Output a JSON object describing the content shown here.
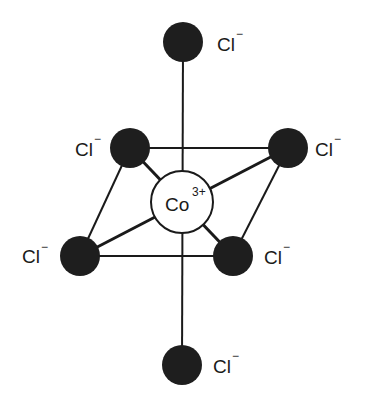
{
  "diagram": {
    "title": "",
    "type": "octahedral complex",
    "central_atom": {
      "symbol": "Co",
      "charge": "3+",
      "x": 182,
      "y": 202,
      "r": 31
    },
    "ligands": [
      {
        "id": "top",
        "symbol": "Cl",
        "charge": "−",
        "x": 183,
        "y": 42,
        "lx": 217,
        "ly": 51
      },
      {
        "id": "upper-left",
        "symbol": "Cl",
        "charge": "−",
        "x": 130,
        "y": 148,
        "lx": 75,
        "ly": 156
      },
      {
        "id": "upper-right",
        "symbol": "Cl",
        "charge": "−",
        "x": 288,
        "y": 148,
        "lx": 315,
        "ly": 156
      },
      {
        "id": "lower-left",
        "symbol": "Cl",
        "charge": "−",
        "x": 80,
        "y": 256,
        "lx": 22,
        "ly": 263
      },
      {
        "id": "lower-right",
        "symbol": "Cl",
        "charge": "−",
        "x": 233,
        "y": 256,
        "lx": 264,
        "ly": 264
      },
      {
        "id": "bottom",
        "symbol": "Cl",
        "charge": "−",
        "x": 182,
        "y": 365,
        "lx": 213,
        "ly": 373
      }
    ],
    "colors": {
      "ligand_fill": "#1e1e1e",
      "line": "#1a1a1a",
      "center_fill": "#ffffff"
    }
  }
}
